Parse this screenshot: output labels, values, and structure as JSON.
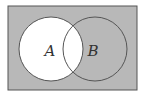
{
  "diagram": {
    "type": "venn",
    "shaded_region": "complement of A",
    "colors": {
      "shaded": "#b8b8b8",
      "unshaded": "#ffffff",
      "stroke": "#555555"
    },
    "universe": {
      "x": 8,
      "y": 6,
      "width": 129,
      "height": 84
    },
    "sets": [
      {
        "label": "A",
        "cx": 51,
        "cy": 49,
        "r": 32,
        "label_x": 50,
        "label_y": 56
      },
      {
        "label": "B",
        "cx": 95,
        "cy": 49,
        "r": 32,
        "label_x": 93,
        "label_y": 56
      }
    ]
  }
}
